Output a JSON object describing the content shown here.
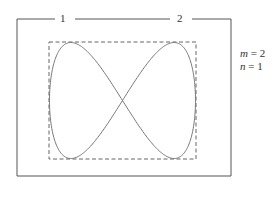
{
  "diagram": {
    "type": "lissajous-figure",
    "channel_labels": [
      "1",
      "2"
    ],
    "parameters": {
      "m_label": "m",
      "m_value": "2",
      "n_label": "n",
      "n_value": "1",
      "m_text": "= 2",
      "n_text": "= 1"
    },
    "colors": {
      "frame": "#555555",
      "dashed_box": "#666666",
      "curve": "#777777",
      "text": "#333333"
    }
  }
}
